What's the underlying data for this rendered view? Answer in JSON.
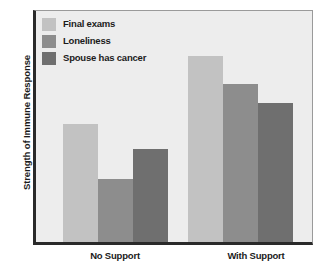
{
  "chart_data": {
    "type": "bar",
    "title": "",
    "subtitle": "",
    "xlabel": "",
    "ylabel": "Strength of Immune Response",
    "categories": [
      "No Support",
      "With Support"
    ],
    "series": [
      {
        "name": "Final exams",
        "color": "#c2c2c2",
        "values": [
          51,
          80
        ]
      },
      {
        "name": "Loneliness",
        "color": "#8d8d8d",
        "values": [
          27,
          68
        ]
      },
      {
        "name": "Spouse has cancer",
        "color": "#6f6f6f",
        "values": [
          40,
          60
        ]
      }
    ],
    "ylim": [
      0,
      100
    ],
    "yticks": [],
    "ytick_labels": [],
    "grid": false,
    "legend_position": "top-left",
    "axis_color": "#2a2a2a",
    "plot_background": "#ededed",
    "page_background": "#ffffff"
  },
  "legend": {
    "items": [
      {
        "label": "Final exams",
        "color": "#c2c2c2"
      },
      {
        "label": "Loneliness",
        "color": "#8d8d8d"
      },
      {
        "label": "Spouse has cancer",
        "color": "#6f6f6f"
      }
    ]
  },
  "axes": {
    "y_title": "Strength of Immune Response",
    "x_categories": [
      "No Support",
      "With Support"
    ]
  }
}
